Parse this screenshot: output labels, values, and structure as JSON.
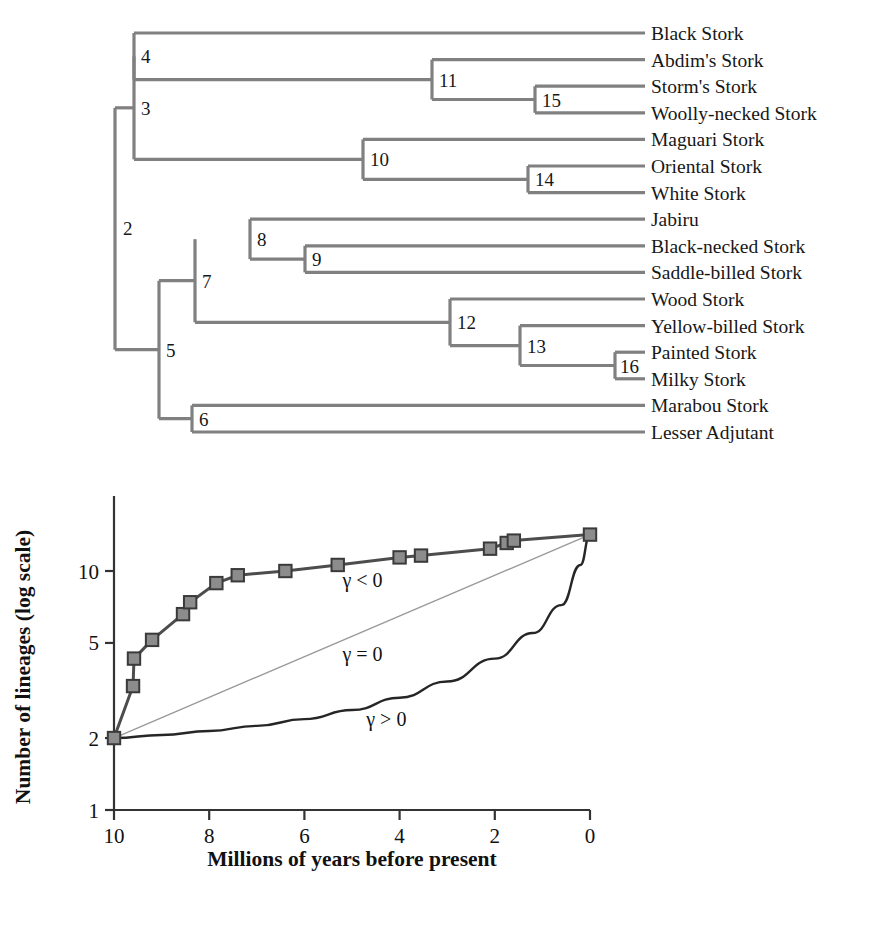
{
  "figure": {
    "tree": {
      "tip_labels": [
        "Black Stork",
        "Abdim's Stork",
        "Storm's Stork",
        "Woolly-necked Stork",
        "Maguari Stork",
        "Oriental Stork",
        "White Stork",
        "Jabiru",
        "Black-necked Stork",
        "Saddle-billed Stork",
        "Wood Stork",
        "Yellow-billed Stork",
        "Painted Stork",
        "Milky Stork",
        "Marabou Stork",
        "Lesser Adjutant"
      ],
      "node_numbers": [
        "2",
        "3",
        "4",
        "5",
        "6",
        "7",
        "8",
        "9",
        "10",
        "11",
        "12",
        "13",
        "14",
        "15",
        "16"
      ],
      "branch_color": "#808080",
      "label_color": "#171717"
    },
    "chart_data": {
      "type": "line",
      "title": "",
      "xlabel": "Millions of years before present",
      "ylabel": "Number of lineages (log scale)",
      "xlim": [
        10,
        0
      ],
      "ylim": [
        1,
        16
      ],
      "yscale": "log",
      "xticks": [
        10,
        8,
        6,
        4,
        2,
        0
      ],
      "xtick_labels": [
        "10",
        "8",
        "6",
        "4",
        "2",
        "0"
      ],
      "yticks": [
        1,
        2,
        5,
        10
      ],
      "ytick_labels": [
        "1",
        "2",
        "5",
        "10"
      ],
      "grid": false,
      "legend": "none",
      "annotations": [
        {
          "text": "γ < 0",
          "x": 5.2,
          "y": 8.6
        },
        {
          "text": "γ = 0",
          "x": 5.2,
          "y": 4.2
        },
        {
          "text": "γ > 0",
          "x": 4.7,
          "y": 2.25
        }
      ],
      "series": [
        {
          "name": "Observed lineages-through-time (gamma < 0)",
          "color": "#4d4d4d",
          "marker": "square",
          "marker_fill": "#8c8c8c",
          "marker_edge": "#3a3a3a",
          "x": [
            10.0,
            9.6,
            9.58,
            9.2,
            8.55,
            8.4,
            7.85,
            7.4,
            6.4,
            5.3,
            4.0,
            3.55,
            2.1,
            1.75,
            1.6,
            0.0
          ],
          "y": [
            2,
            3.3,
            4.3,
            5.15,
            6.6,
            7.4,
            8.9,
            9.6,
            10.0,
            10.6,
            11.4,
            11.6,
            12.4,
            13.1,
            13.4,
            14.2
          ]
        },
        {
          "name": "Constant-rate expectation (gamma = 0)",
          "color": "#9a9a9a",
          "marker": "none",
          "x": [
            10.0,
            0.0
          ],
          "y": [
            2,
            14.2
          ]
        },
        {
          "name": "Accelerating expectation (gamma > 0)",
          "color": "#262626",
          "marker": "none",
          "x": [
            10.0,
            9.0,
            8.0,
            7.0,
            6.0,
            5.0,
            4.0,
            3.0,
            2.0,
            1.2,
            0.6,
            0.2,
            0.0
          ],
          "y": [
            2.0,
            2.06,
            2.14,
            2.25,
            2.4,
            2.62,
            2.95,
            3.45,
            4.3,
            5.5,
            7.2,
            10.6,
            14.2
          ]
        }
      ]
    }
  }
}
